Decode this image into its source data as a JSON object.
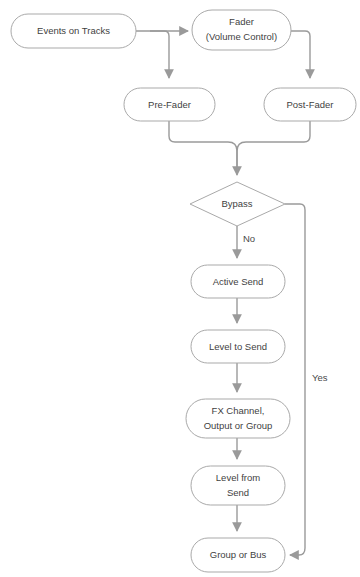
{
  "diagram": {
    "background_color": "#ffffff",
    "node_stroke_color": "#a9a9a9",
    "node_fill_color": "#ffffff",
    "edge_color": "#9a9a9a",
    "text_color": "#3f3f3f",
    "nodes": [
      {
        "id": "events-on-tracks",
        "label": "Events on Tracks",
        "shape": "rounded-rect"
      },
      {
        "id": "fader",
        "label_line1": "Fader",
        "label_line2": "(Volume Control)",
        "shape": "rounded-rect"
      },
      {
        "id": "pre-fader",
        "label": "Pre-Fader",
        "shape": "rounded-rect"
      },
      {
        "id": "post-fader",
        "label": "Post-Fader",
        "shape": "rounded-rect"
      },
      {
        "id": "bypass",
        "label": "Bypass",
        "shape": "diamond"
      },
      {
        "id": "active-send",
        "label": "Active Send",
        "shape": "rounded-rect"
      },
      {
        "id": "level-to-send",
        "label": "Level to Send",
        "shape": "rounded-rect"
      },
      {
        "id": "fx-channel",
        "label_line1": "FX Channel,",
        "label_line2": "Output or Group",
        "shape": "rounded-rect"
      },
      {
        "id": "level-from-send",
        "label_line1": "Level from",
        "label_line2": "Send",
        "shape": "rounded-rect"
      },
      {
        "id": "group-or-bus",
        "label": "Group or Bus",
        "shape": "rounded-rect"
      }
    ],
    "edge_labels": {
      "bypass_no": "No",
      "bypass_yes": "Yes"
    }
  }
}
